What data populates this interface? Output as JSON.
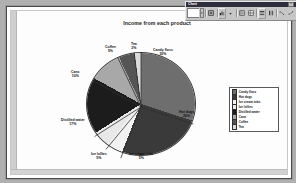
{
  "window": {
    "toolbar_title": "Chart",
    "close_label": "×",
    "chart_object_value": "",
    "dropdown_arrow": "▾",
    "buttons": [
      {
        "name": "format-object-button",
        "icon": "format-object-icon"
      },
      {
        "name": "chart-type-button",
        "icon": "chart-type-icon"
      },
      {
        "name": "chart-type-dropdown",
        "icon": "chevron-down-icon"
      },
      {
        "name": "legend-button",
        "icon": "legend-icon"
      },
      {
        "name": "data-table-button",
        "icon": "data-table-icon"
      },
      {
        "name": "by-row-button",
        "icon": "by-row-icon"
      },
      {
        "name": "by-column-button",
        "icon": "by-column-icon"
      },
      {
        "name": "angle-text-down-button",
        "icon": "angle-down-icon"
      },
      {
        "name": "angle-text-up-button",
        "icon": "angle-up-icon"
      }
    ]
  },
  "chart_data": {
    "type": "pie",
    "title": "Income from each product",
    "xlabel": "",
    "ylabel": "",
    "legend_position": "right",
    "grid": false,
    "categories": [
      "Candy floss",
      "Hot dogs",
      "Ice cream tubs",
      "Ice lollies",
      "Distilled water",
      "Cans",
      "Coffee",
      "Tea"
    ],
    "values": [
      30,
      26,
      5,
      5,
      17,
      10,
      5,
      2
    ],
    "value_labels": [
      "30%",
      "26%",
      "5%",
      "5%",
      "17%",
      "10%",
      "5%",
      "2%"
    ],
    "colors": [
      "#6e6e6e",
      "#3a3a3a",
      "#f2f2f2",
      "#e8e8e8",
      "#1c1c1c",
      "#a8a8a8",
      "#555555",
      "#dcdcdc"
    ],
    "slices": [
      {
        "label": "Candy floss",
        "value": 30,
        "pct": "30%",
        "color": "#6e6e6e"
      },
      {
        "label": "Hot dogs",
        "value": 26,
        "pct": "26%",
        "color": "#3a3a3a"
      },
      {
        "label": "Ice cream tubs",
        "value": 5,
        "pct": "5%",
        "color": "#f2f2f2"
      },
      {
        "label": "Ice lollies",
        "value": 5,
        "pct": "5%",
        "color": "#e8e8e8"
      },
      {
        "label": "Distilled water",
        "value": 17,
        "pct": "17%",
        "color": "#1c1c1c"
      },
      {
        "label": "Cans",
        "value": 10,
        "pct": "10%",
        "color": "#a8a8a8"
      },
      {
        "label": "Coffee",
        "value": 5,
        "pct": "5%",
        "color": "#555555"
      },
      {
        "label": "Tea",
        "value": 2,
        "pct": "2%",
        "color": "#dcdcdc"
      }
    ]
  },
  "legend": {
    "items": [
      {
        "label": "Candy floss",
        "color": "#6e6e6e"
      },
      {
        "label": "Hot dogs",
        "color": "#3a3a3a"
      },
      {
        "label": "Ice cream tubs",
        "color": "#f2f2f2"
      },
      {
        "label": "Ice lollies",
        "color": "#e8e8e8"
      },
      {
        "label": "Distilled water",
        "color": "#1c1c1c"
      },
      {
        "label": "Cans",
        "color": "#a8a8a8"
      },
      {
        "label": "Coffee",
        "color": "#555555"
      },
      {
        "label": "Tea",
        "color": "#dcdcdc"
      }
    ]
  }
}
